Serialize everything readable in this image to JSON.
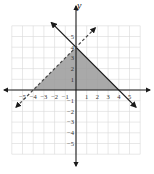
{
  "chart_data": {
    "type": "line",
    "title": "",
    "xlabel": "",
    "ylabel": "y",
    "xlim": [
      -6,
      6
    ],
    "ylim": [
      -6,
      6
    ],
    "grid": true,
    "x_ticks": [
      -5,
      -4,
      -3,
      -2,
      -1,
      1,
      2,
      3,
      4,
      5
    ],
    "y_ticks": [
      -5,
      -4,
      -3,
      -2,
      -1,
      1,
      2,
      3,
      4,
      5
    ],
    "x_tick_labels": [
      "−5",
      "−4",
      "−3",
      "−2",
      "−1",
      "1",
      "2",
      "3",
      "4",
      "5"
    ],
    "y_tick_labels": [
      "−5",
      "−4",
      "−3",
      "−2",
      "−1",
      "1",
      "2",
      "3",
      "4",
      "5"
    ],
    "series": [
      {
        "name": "y = -x + 4",
        "style": "solid",
        "slope": -1,
        "intercept": 4,
        "x_range": [
          -2.3,
          5.6
        ],
        "arrows": "both"
      },
      {
        "name": "y = x + 4",
        "style": "dashed",
        "slope": 1,
        "intercept": 4,
        "x_range": [
          -5.6,
          1.8
        ],
        "arrows": "both"
      }
    ],
    "shaded_region": {
      "description": "feasible region",
      "vertices": [
        [
          -4,
          0
        ],
        [
          0,
          4
        ],
        [
          4,
          0
        ]
      ],
      "color": "#9a9a9a"
    },
    "colors": {
      "axis": "#1a1a1a",
      "grid": "#d9d9d9",
      "shade": "#9a9a9a"
    }
  }
}
